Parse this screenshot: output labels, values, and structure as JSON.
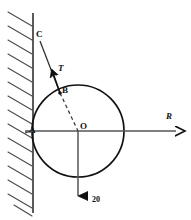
{
  "figure": {
    "type": "mechanics-free-body-diagram",
    "labels": {
      "wall_contact_point": "A",
      "cable_attach_point_on_wall": "C",
      "cable_attach_point_on_cylinder": "B",
      "center": "O",
      "tension_force": "T",
      "reaction_force": "R",
      "weight_value": "20"
    },
    "colors": {
      "ink": "#111111",
      "line": "#333333",
      "hatch": "#4a4a4a",
      "background": "#ffffff"
    },
    "geometry": {
      "wall_x": 33,
      "wall_top_y": 14,
      "wall_bottom_y": 212,
      "circle_center_x": 78,
      "circle_center_y": 131,
      "circle_radius": 46,
      "point_C_x": 42,
      "point_C_y": 42,
      "point_B_x": 59,
      "point_B_y": 92,
      "point_A_x": 33,
      "point_A_y": 131,
      "axis_right_end_x": 178,
      "weight_arrow_end_y": 198
    }
  }
}
